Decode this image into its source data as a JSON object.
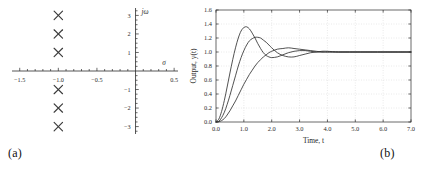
{
  "figure": {
    "caption_a": "(a)",
    "caption_b": "(b)"
  },
  "chart_data": [
    {
      "type": "scatter",
      "panel": "a",
      "title": "",
      "xlabel": "σ",
      "ylabel": "jω",
      "xlim": [
        -1.6,
        0.55
      ],
      "ylim": [
        -3.4,
        3.4
      ],
      "xticks": [
        -1.5,
        -1.0,
        -0.5,
        0.5
      ],
      "xtick_labels": [
        "-1.5",
        "-1.0",
        "-0.5",
        "0.5"
      ],
      "yticks": [
        3,
        2,
        1,
        -1,
        -2,
        -3
      ],
      "ytick_labels": [
        "3",
        "2",
        "1",
        "-1",
        "-2",
        "-3"
      ],
      "xminor_step": 0.1,
      "yminor_step": 0.25,
      "grid": false,
      "marker": "x",
      "series": [
        {
          "name": "poles",
          "x": [
            -1.0,
            -1.0,
            -1.0,
            -1.0,
            -1.0,
            -1.0
          ],
          "y": [
            3.0,
            2.0,
            1.0,
            -1.0,
            -2.0,
            -3.0
          ]
        }
      ]
    },
    {
      "type": "line",
      "panel": "b",
      "title": "",
      "xlabel": "Time, t",
      "ylabel": "Output, y(t)",
      "xlim": [
        0.0,
        7.0
      ],
      "ylim": [
        0.0,
        1.6
      ],
      "xticks": [
        0.0,
        1.0,
        2.0,
        3.0,
        4.0,
        5.0,
        6.0,
        7.0
      ],
      "xtick_labels": [
        "0.0",
        "1.0",
        "2.0",
        "3.0",
        "4.0",
        "5.0",
        "6.0",
        "7.0"
      ],
      "yticks": [
        0.0,
        0.2,
        0.4,
        0.6,
        0.8,
        1.0,
        1.2,
        1.4,
        1.6
      ],
      "ytick_labels": [
        "0.0",
        "0.2",
        "0.4",
        "0.6",
        "0.8",
        "1.0",
        "1.2",
        "1.4",
        "1.6"
      ],
      "grid": true,
      "legend": "none",
      "x": [
        0.0,
        0.1,
        0.2,
        0.3,
        0.4,
        0.5,
        0.6,
        0.7,
        0.8,
        0.9,
        1.0,
        1.1,
        1.2,
        1.3,
        1.4,
        1.5,
        1.6,
        1.7,
        1.8,
        1.9,
        2.0,
        2.2,
        2.4,
        2.6,
        2.8,
        3.0,
        3.2,
        3.4,
        3.6,
        3.8,
        4.0,
        4.4,
        4.8,
        5.2,
        5.6,
        6.0,
        6.5,
        7.0
      ],
      "series": [
        {
          "name": "curve-1",
          "values": [
            0.0,
            0.04,
            0.15,
            0.31,
            0.5,
            0.7,
            0.89,
            1.06,
            1.2,
            1.3,
            1.35,
            1.36,
            1.33,
            1.27,
            1.2,
            1.12,
            1.05,
            0.99,
            0.95,
            0.93,
            0.92,
            0.93,
            0.96,
            0.99,
            1.01,
            1.02,
            1.02,
            1.01,
            1.0,
            1.0,
            1.0,
            1.0,
            1.0,
            1.0,
            1.0,
            1.0,
            1.0,
            1.0
          ]
        },
        {
          "name": "curve-2",
          "values": [
            0.0,
            0.01,
            0.06,
            0.14,
            0.25,
            0.38,
            0.52,
            0.66,
            0.8,
            0.92,
            1.02,
            1.1,
            1.16,
            1.19,
            1.21,
            1.21,
            1.2,
            1.17,
            1.14,
            1.1,
            1.06,
            0.99,
            0.95,
            0.93,
            0.93,
            0.95,
            0.97,
            0.99,
            1.0,
            1.01,
            1.01,
            1.0,
            1.0,
            1.0,
            1.0,
            1.0,
            1.0,
            1.0
          ]
        },
        {
          "name": "curve-3",
          "values": [
            0.0,
            0.005,
            0.02,
            0.05,
            0.1,
            0.16,
            0.23,
            0.3,
            0.38,
            0.46,
            0.54,
            0.61,
            0.68,
            0.74,
            0.8,
            0.85,
            0.89,
            0.93,
            0.96,
            0.99,
            1.01,
            1.04,
            1.05,
            1.06,
            1.05,
            1.04,
            1.03,
            1.02,
            1.01,
            1.0,
            1.0,
            1.0,
            1.0,
            1.0,
            1.0,
            1.0,
            1.0,
            1.0
          ]
        }
      ]
    }
  ]
}
